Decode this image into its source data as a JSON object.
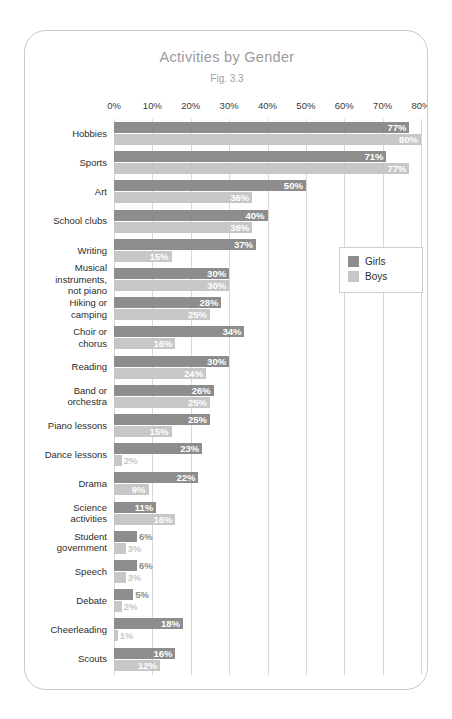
{
  "chart_data": {
    "type": "bar",
    "orientation": "horizontal",
    "title": "Activities by Gender",
    "subtitle": "Fig. 3.3",
    "xlabel": "",
    "ylabel": "",
    "xlim": [
      0,
      80
    ],
    "xtick_labels": [
      "0%",
      "10%",
      "20%",
      "30%",
      "40%",
      "50%",
      "60%",
      "70%",
      "80%"
    ],
    "xtick_values": [
      0,
      10,
      20,
      30,
      40,
      50,
      60,
      70,
      80
    ],
    "grid": true,
    "legend_position": "right",
    "categories": [
      "Hobbies",
      "Sports",
      "Art",
      "School clubs",
      "Writing",
      "Musical instruments, not piano",
      "Hiking or camping",
      "Choir or chorus",
      "Reading",
      "Band or orchestra",
      "Piano lessons",
      "Dance lessons",
      "Drama",
      "Science activities",
      "Student government",
      "Speech",
      "Debate",
      "Cheerleading",
      "Scouts"
    ],
    "series": [
      {
        "name": "Girls",
        "color": "#8d8d8d",
        "values": [
          77,
          71,
          50,
          40,
          37,
          30,
          28,
          34,
          30,
          26,
          25,
          23,
          22,
          11,
          6,
          6,
          5,
          18,
          16
        ],
        "labels": [
          "77%",
          "71%",
          "50%",
          "40%",
          "37%",
          "30%",
          "28%",
          "34%",
          "30%",
          "26%",
          "25%",
          "23%",
          "22%",
          "11%",
          "6%",
          "6%",
          "5%",
          "18%",
          "16%"
        ]
      },
      {
        "name": "Boys",
        "color": "#c7c7c7",
        "values": [
          80,
          77,
          36,
          36,
          15,
          30,
          25,
          16,
          24,
          25,
          15,
          2,
          9,
          16,
          3,
          3,
          2,
          1,
          12
        ],
        "labels": [
          "80%",
          "77%",
          "36%",
          "36%",
          "15%",
          "30%",
          "25%",
          "16%",
          "24%",
          "25%",
          "15%",
          "2%",
          "9%",
          "16%",
          "3%",
          "3%",
          "2%",
          "1%",
          "12%"
        ]
      }
    ],
    "category_lines": [
      [
        "Hobbies"
      ],
      [
        "Sports"
      ],
      [
        "Art"
      ],
      [
        "School clubs"
      ],
      [
        "Writing"
      ],
      [
        "Musical",
        "instruments,",
        "not piano"
      ],
      [
        "Hiking or",
        "camping"
      ],
      [
        "Choir or",
        "chorus"
      ],
      [
        "Reading"
      ],
      [
        "Band or",
        "orchestra"
      ],
      [
        "Piano lessons"
      ],
      [
        "Dance lessons"
      ],
      [
        "Drama"
      ],
      [
        "Science",
        "activities"
      ],
      [
        "Student",
        "government"
      ],
      [
        "Speech"
      ],
      [
        "Debate"
      ],
      [
        "Cheerleading"
      ],
      [
        "Scouts"
      ]
    ]
  },
  "legend": {
    "items": [
      {
        "label": "Girls",
        "color": "#8d8d8d"
      },
      {
        "label": "Boys",
        "color": "#c7c7c7"
      }
    ]
  }
}
